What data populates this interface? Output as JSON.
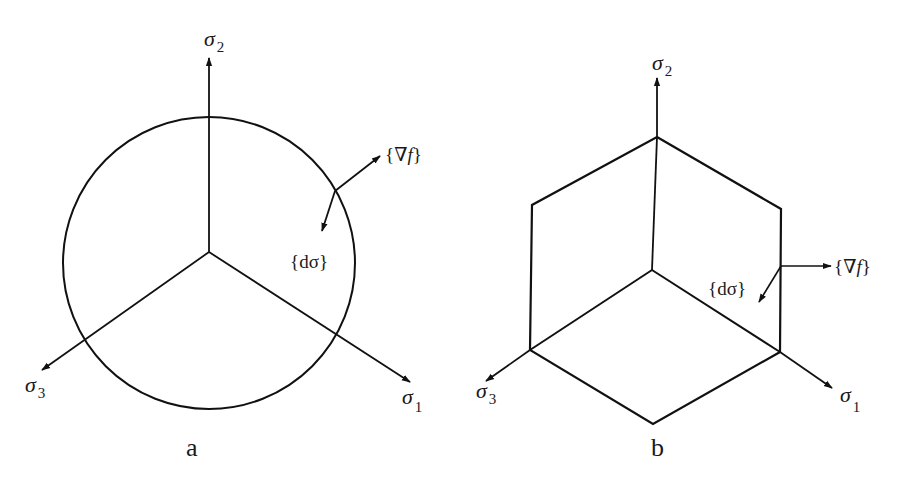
{
  "figure": {
    "panels": [
      {
        "id": "a",
        "caption": "a",
        "yield_surface": "circle",
        "axes": [
          {
            "symbol": "σ",
            "subscript": "2",
            "direction": "up"
          },
          {
            "symbol": "σ",
            "subscript": "3",
            "direction": "lower-left"
          },
          {
            "symbol": "σ",
            "subscript": "1",
            "direction": "lower-right"
          }
        ],
        "vectors": [
          {
            "label_open": "{",
            "label_body": "∇f",
            "label_close": "}",
            "meaning": "normal to yield surface"
          },
          {
            "label_open": "{",
            "label_body": "dσ",
            "label_close": "}",
            "meaning": "stress increment"
          }
        ]
      },
      {
        "id": "b",
        "caption": "b",
        "yield_surface": "hexagon",
        "axes": [
          {
            "symbol": "σ",
            "subscript": "2",
            "direction": "up"
          },
          {
            "symbol": "σ",
            "subscript": "3",
            "direction": "lower-left"
          },
          {
            "symbol": "σ",
            "subscript": "1",
            "direction": "lower-right"
          }
        ],
        "vectors": [
          {
            "label_open": "{",
            "label_body": "∇f",
            "label_close": "}",
            "meaning": "normal to yield surface"
          },
          {
            "label_open": "{",
            "label_body": "dσ",
            "label_close": "}",
            "meaning": "stress increment"
          }
        ]
      }
    ],
    "colors": {
      "stroke": "#111111",
      "text": "#1a1a1a",
      "background": "#ffffff"
    }
  }
}
